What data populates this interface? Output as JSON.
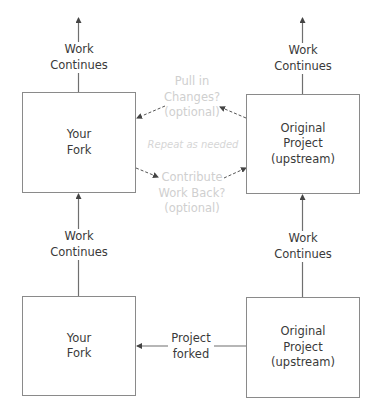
{
  "diagram": {
    "colors": {
      "line": "#6f6f6f",
      "box_border": "#8a8a8a",
      "text": "#3a3a3a",
      "faint_text": "#cfcfcf",
      "dashed": "#555555"
    },
    "nodes": {
      "your_fork_top": {
        "lines": [
          "Your",
          "Fork"
        ]
      },
      "upstream_top": {
        "lines": [
          "Original",
          "Project",
          "(upstream)"
        ]
      },
      "your_fork_bottom": {
        "lines": [
          "Your",
          "Fork"
        ]
      },
      "upstream_bottom": {
        "lines": [
          "Original",
          "Project",
          "(upstream)"
        ]
      }
    },
    "edge_labels": {
      "left_top_continues": {
        "lines": [
          "Work",
          "Continues"
        ]
      },
      "right_top_continues": {
        "lines": [
          "Work",
          "Continues"
        ]
      },
      "left_mid_continues": {
        "lines": [
          "Work",
          "Continues"
        ]
      },
      "right_mid_continues": {
        "lines": [
          "Work",
          "Continues"
        ]
      },
      "project_forked": {
        "lines": [
          "Project",
          "forked"
        ]
      },
      "pull_in_changes": {
        "lines": [
          "Pull in",
          "Changes?",
          "(optional)"
        ]
      },
      "repeat": {
        "text": "Repeat as needed"
      },
      "contribute_back": {
        "lines": [
          "Contribute",
          "Work Back?",
          "(optional)"
        ]
      }
    }
  }
}
